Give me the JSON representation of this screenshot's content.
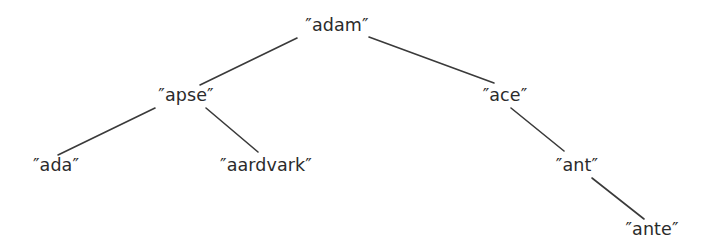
{
  "figure": {
    "background_color": "#ffffff",
    "text_color": "#2b2b2b",
    "edge_color": "#3a3a3a",
    "edge_width": 1.6
  },
  "tree": {
    "nodes": [
      {
        "id": "adam",
        "label": "″adam″",
        "x": 337,
        "y": 26,
        "level": 0
      },
      {
        "id": "apse",
        "label": "″apse″",
        "x": 186,
        "y": 96,
        "level": 1
      },
      {
        "id": "ace",
        "label": "″ace″",
        "x": 505,
        "y": 96,
        "level": 1
      },
      {
        "id": "ada",
        "label": "″ada″",
        "x": 56,
        "y": 166,
        "level": 2
      },
      {
        "id": "aardvark",
        "label": "″aardvark″",
        "x": 266,
        "y": 166,
        "level": 2
      },
      {
        "id": "ant",
        "label": "″ant″",
        "x": 577,
        "y": 166,
        "level": 2
      },
      {
        "id": "ante",
        "label": "″ante″",
        "x": 652,
        "y": 230,
        "level": 3
      }
    ],
    "edges": [
      {
        "id": "edge-adam-apse",
        "from": "adam",
        "to": "apse",
        "x1": 297,
        "y1": 38,
        "x2": 200,
        "y2": 85
      },
      {
        "id": "edge-adam-ace",
        "from": "adam",
        "to": "ace",
        "x1": 369,
        "y1": 37,
        "x2": 494,
        "y2": 83
      },
      {
        "id": "edge-apse-ada",
        "from": "apse",
        "to": "ada",
        "x1": 155,
        "y1": 108,
        "x2": 58,
        "y2": 155
      },
      {
        "id": "edge-apse-aardvark",
        "from": "apse",
        "to": "aardvark",
        "x1": 206,
        "y1": 108,
        "x2": 258,
        "y2": 152
      },
      {
        "id": "edge-ace-ant",
        "from": "ace",
        "to": "ant",
        "x1": 511,
        "y1": 108,
        "x2": 564,
        "y2": 151
      },
      {
        "id": "edge-ant-ante",
        "from": "ant",
        "to": "ante",
        "x1": 592,
        "y1": 178,
        "x2": 644,
        "y2": 219
      }
    ]
  }
}
